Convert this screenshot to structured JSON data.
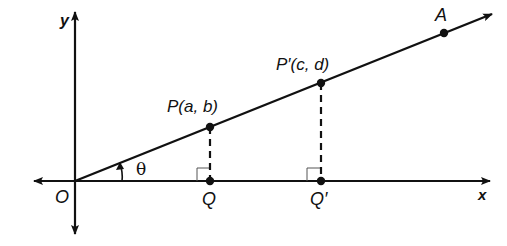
{
  "diagram": {
    "type": "coordinate-geometry",
    "axes": {
      "x_label": "x",
      "y_label": "y",
      "origin_label": "O"
    },
    "angle_label": "θ",
    "ray_point_label": "A",
    "points": [
      {
        "id": "P",
        "label": "P(a, b)"
      },
      {
        "id": "P_prime",
        "label": "P′(c, d)"
      },
      {
        "id": "Q",
        "label": "Q"
      },
      {
        "id": "Q_prime",
        "label": "Q′"
      }
    ],
    "colors": {
      "stroke": "#111111",
      "background": "#ffffff",
      "right_angle": "#555555"
    }
  }
}
